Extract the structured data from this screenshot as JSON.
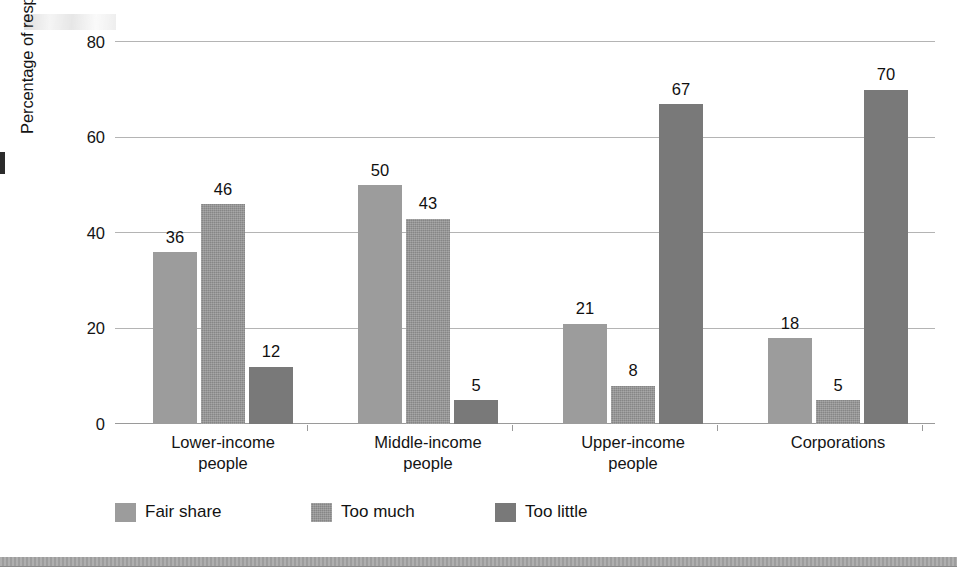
{
  "chart_data": {
    "type": "bar",
    "title": "",
    "subtitle": "",
    "xlabel": "",
    "ylabel": "Percentage of respondents",
    "ylim": [
      0,
      80
    ],
    "yticks": [
      0,
      20,
      40,
      60,
      80
    ],
    "grid": "horizontal",
    "legend_position": "bottom-left",
    "grouping": "grouped",
    "value_labels": true,
    "categories": [
      "Lower-income people",
      "Middle-income people",
      "Upper-income people",
      "Corporations"
    ],
    "category_lines": [
      [
        "Lower-income",
        "people"
      ],
      [
        "Middle-income",
        "people"
      ],
      [
        "Upper-income",
        "people"
      ],
      [
        "Corporations",
        ""
      ]
    ],
    "series": [
      {
        "name": "Fair share",
        "color": "#9c9c9c",
        "values": [
          36,
          50,
          21,
          18
        ]
      },
      {
        "name": "Too much",
        "color": "#868686",
        "values": [
          46,
          43,
          8,
          5
        ]
      },
      {
        "name": "Too little",
        "color": "#797979",
        "values": [
          12,
          5,
          67,
          70
        ]
      }
    ]
  },
  "axis": {
    "y_title": "Percentage of respondents",
    "tick_labels": [
      "80",
      "60",
      "40",
      "20",
      "0"
    ]
  },
  "legend": {
    "items": [
      {
        "label": "Fair share"
      },
      {
        "label": "Too much"
      },
      {
        "label": "Too little"
      }
    ]
  },
  "colors": {
    "fair_share": "#9c9c9c",
    "too_much": "#868686",
    "too_little": "#797979",
    "gridline": "#b4b4b4",
    "axis": "#9a9a9a",
    "text": "#141414",
    "bottom_rule": "#9d9d9d"
  }
}
